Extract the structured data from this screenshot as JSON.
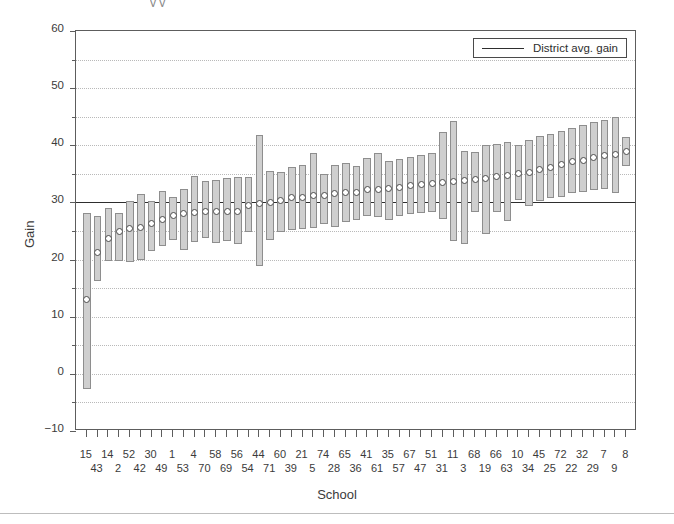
{
  "figure": {
    "axis_title_y": "Gain",
    "axis_title_x": "School",
    "legend_label": "District avg. gain",
    "legend_icon": "horizontal-line-icon",
    "top_caption_fragment": "y                              y"
  },
  "chart_data": {
    "type": "bar",
    "title": "",
    "subtitle": "",
    "xlabel": "School",
    "ylabel": "Gain",
    "ylim": [
      -10,
      60
    ],
    "yticks": [
      -10,
      0,
      10,
      20,
      30,
      40,
      50,
      60
    ],
    "ytick_labels": [
      "−10",
      "0",
      "10",
      "20",
      "30",
      "40",
      "50",
      "60"
    ],
    "yminor_ticks": [
      -5,
      5,
      15,
      25,
      35,
      45,
      55
    ],
    "grid": "horizontal-dotted",
    "legend_position": "top-right",
    "reference_line": {
      "label": "District avg. gain",
      "value": 30.0
    },
    "marker": "white-circle-point-estimate",
    "bar_meaning": "confidence-interval-range",
    "categories": [
      "15",
      "43",
      "14",
      "2",
      "52",
      "42",
      "30",
      "49",
      "1",
      "53",
      "4",
      "70",
      "58",
      "69",
      "56",
      "54",
      "44",
      "71",
      "60",
      "39",
      "21",
      "5",
      "74",
      "28",
      "65",
      "36",
      "41",
      "61",
      "35",
      "57",
      "67",
      "47",
      "51",
      "31",
      "11",
      "3",
      "68",
      "19",
      "66",
      "63",
      "10",
      "34",
      "45",
      "25",
      "72",
      "22",
      "32",
      "29",
      "7",
      "9",
      "8"
    ],
    "series": [
      {
        "name": "Estimated gain (point estimate)",
        "values": [
          13.0,
          21.3,
          23.7,
          24.9,
          25.4,
          25.6,
          26.4,
          27.0,
          27.7,
          28.0,
          28.2,
          28.5,
          28.5,
          28.5,
          28.4,
          29.5,
          29.9,
          30.0,
          30.4,
          30.9,
          30.8,
          31.3,
          31.3,
          31.5,
          31.7,
          31.8,
          32.2,
          32.3,
          32.4,
          32.6,
          33.0,
          33.2,
          33.4,
          33.5,
          33.6,
          33.8,
          34.0,
          34.2,
          34.5,
          34.7,
          35.0,
          35.2,
          35.7,
          36.2,
          36.6,
          37.2,
          37.4,
          37.9,
          38.2,
          38.4,
          39.0
        ]
      },
      {
        "name": "Interval lower bound",
        "values": [
          -2.6,
          16.3,
          19.7,
          19.8,
          19.6,
          20.0,
          21.5,
          22.4,
          23.4,
          21.6,
          23.0,
          23.7,
          22.9,
          23.2,
          22.7,
          24.9,
          18.8,
          23.4,
          24.8,
          25.1,
          25.4,
          25.6,
          26.2,
          25.7,
          26.5,
          27.0,
          27.6,
          27.4,
          27.0,
          27.6,
          28.0,
          28.2,
          28.4,
          27.1,
          23.3,
          22.7,
          28.4,
          24.5,
          28.4,
          26.7,
          30.5,
          29.4,
          30.2,
          30.8,
          31.0,
          31.6,
          31.9,
          32.2,
          32.4,
          31.7,
          36.3
        ]
      },
      {
        "name": "Interval upper bound",
        "values": [
          28.1,
          27.6,
          29.0,
          28.2,
          30.3,
          31.4,
          30.2,
          32.0,
          31.0,
          32.4,
          34.7,
          33.7,
          33.9,
          34.2,
          34.4,
          34.5,
          41.8,
          35.5,
          35.3,
          36.2,
          36.6,
          38.6,
          35.0,
          36.6,
          36.9,
          36.3,
          37.7,
          38.6,
          37.2,
          37.6,
          38.0,
          38.3,
          38.7,
          42.4,
          44.2,
          39.0,
          38.8,
          40.0,
          40.3,
          40.5,
          40.0,
          41.0,
          41.6,
          42.0,
          42.5,
          43.0,
          43.5,
          44.1,
          44.5,
          45.0,
          41.5
        ]
      }
    ]
  }
}
